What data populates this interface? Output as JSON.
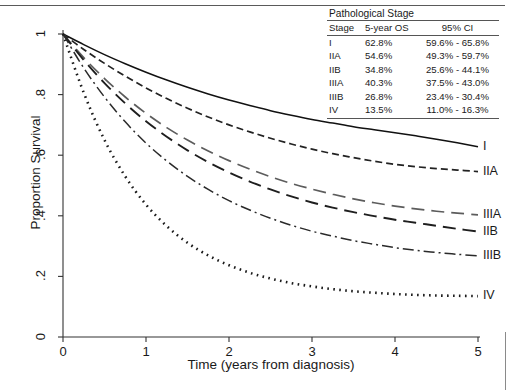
{
  "figure": {
    "width": 513,
    "height": 390,
    "background": "#ffffff",
    "rule_color": "#5a5a5a"
  },
  "chart_data": {
    "type": "line",
    "title": "",
    "xlabel": "Time (years from diagnosis)",
    "ylabel": "Proportion Survival",
    "xlim": [
      0,
      5
    ],
    "ylim": [
      0,
      1
    ],
    "xticks": [
      "0",
      "1",
      "2",
      "3",
      "4",
      "5"
    ],
    "xtick_values": [
      0,
      1,
      2,
      3,
      4,
      5
    ],
    "yticks": [
      "0",
      ".2",
      ".4",
      ".6",
      ".8",
      "1"
    ],
    "ytick_values": [
      0,
      0.2,
      0.4,
      0.6,
      0.8,
      1
    ],
    "grid": false,
    "legend_position": "curve-end-labels-right",
    "x": [
      0,
      0.25,
      0.5,
      0.75,
      1,
      1.25,
      1.5,
      1.75,
      2,
      2.25,
      2.5,
      2.75,
      3,
      3.25,
      3.5,
      3.75,
      4,
      4.25,
      4.5,
      4.75,
      5
    ],
    "series": [
      {
        "name": "I",
        "label": "I",
        "linestyle": "solid",
        "color": "#111111",
        "five_year_os": 0.628,
        "values": [
          1.0,
          0.965,
          0.932,
          0.902,
          0.874,
          0.848,
          0.824,
          0.802,
          0.782,
          0.764,
          0.747,
          0.732,
          0.718,
          0.706,
          0.694,
          0.684,
          0.674,
          0.664,
          0.653,
          0.641,
          0.628
        ]
      },
      {
        "name": "IIA",
        "label": "IIA",
        "linestyle": "dashed",
        "color": "#222222",
        "five_year_os": 0.546,
        "values": [
          1.0,
          0.949,
          0.903,
          0.861,
          0.822,
          0.787,
          0.755,
          0.726,
          0.7,
          0.677,
          0.656,
          0.637,
          0.62,
          0.605,
          0.592,
          0.58,
          0.57,
          0.562,
          0.556,
          0.551,
          0.546
        ]
      },
      {
        "name": "IIIA",
        "label": "IIIA",
        "linestyle": "longdash-light",
        "color": "#5c5c5c",
        "five_year_os": 0.403,
        "values": [
          1.0,
          0.922,
          0.853,
          0.792,
          0.738,
          0.691,
          0.65,
          0.614,
          0.582,
          0.554,
          0.529,
          0.507,
          0.488,
          0.471,
          0.456,
          0.443,
          0.432,
          0.423,
          0.415,
          0.409,
          0.403
        ]
      },
      {
        "name": "IIB",
        "label": "IIB",
        "linestyle": "longdash",
        "color": "#1e1e1e",
        "five_year_os": 0.348,
        "values": [
          1.0,
          0.914,
          0.838,
          0.771,
          0.712,
          0.661,
          0.616,
          0.577,
          0.543,
          0.513,
          0.487,
          0.464,
          0.444,
          0.427,
          0.412,
          0.399,
          0.387,
          0.377,
          0.367,
          0.357,
          0.348
        ]
      },
      {
        "name": "IIIB",
        "label": "IIIB",
        "linestyle": "dashdot",
        "color": "#2a2a2a",
        "five_year_os": 0.268,
        "values": [
          1.0,
          0.888,
          0.792,
          0.71,
          0.64,
          0.581,
          0.53,
          0.487,
          0.45,
          0.419,
          0.392,
          0.369,
          0.349,
          0.333,
          0.318,
          0.306,
          0.295,
          0.286,
          0.279,
          0.273,
          0.268
        ]
      },
      {
        "name": "IV",
        "label": "IV",
        "linestyle": "dotted",
        "color": "#1a1a1a",
        "five_year_os": 0.135,
        "values": [
          1.0,
          0.806,
          0.65,
          0.53,
          0.437,
          0.366,
          0.311,
          0.269,
          0.237,
          0.212,
          0.193,
          0.178,
          0.167,
          0.158,
          0.151,
          0.146,
          0.142,
          0.139,
          0.137,
          0.136,
          0.135
        ]
      }
    ]
  },
  "stats_table": {
    "caption": "Pathological Stage",
    "columns": [
      "Stage",
      "5-year OS",
      "95% CI"
    ],
    "rows": [
      {
        "stage": "I",
        "os": "62.8%",
        "ci": "59.6% - 65.8%"
      },
      {
        "stage": "IIA",
        "os": "54.6%",
        "ci": "49.3% - 59.7%"
      },
      {
        "stage": "IIB",
        "os": "34.8%",
        "ci": "25.6% - 44.1%"
      },
      {
        "stage": "IIIA",
        "os": "40.3%",
        "ci": "37.5% - 43.0%"
      },
      {
        "stage": "IIIB",
        "os": "26.8%",
        "ci": "23.4% - 30.4%"
      },
      {
        "stage": "IV",
        "os": "13.5%",
        "ci": "11.0% - 16.3%"
      }
    ]
  }
}
